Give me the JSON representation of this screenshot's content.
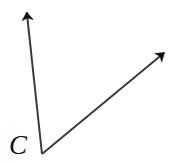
{
  "figure": {
    "type": "angle-diagram",
    "background_color": "#ffffff",
    "stroke_color": "#3a3a3f",
    "arrowhead_color": "#111111",
    "stroke_width": 2,
    "width": 175,
    "height": 165,
    "vertex": {
      "label": "C",
      "label_name": "vertex-label-c",
      "x": 42,
      "y": 154,
      "label_x": 9,
      "label_y": 132
    },
    "rays": [
      {
        "name": "ray-upper-left",
        "from_x": 42,
        "from_y": 154,
        "to_x": 26,
        "to_y": 5,
        "direction": "up",
        "arrowhead": true
      },
      {
        "name": "ray-upper-right",
        "from_x": 42,
        "from_y": 154,
        "to_x": 170,
        "to_y": 48,
        "direction": "up-right",
        "arrowhead": true
      }
    ]
  }
}
